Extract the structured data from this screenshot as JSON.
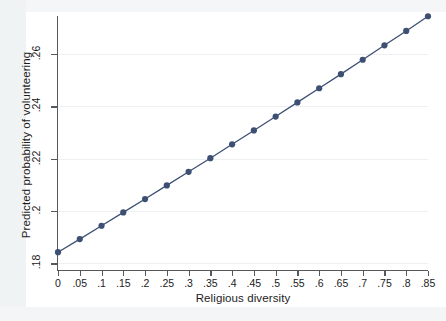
{
  "chart_data": {
    "type": "line",
    "title": "",
    "subtitle": "",
    "xlabel": "Religious diversity",
    "ylabel": "Predicted probability of volunteering",
    "x": [
      0,
      0.05,
      0.1,
      0.15,
      0.2,
      0.25,
      0.3,
      0.35,
      0.4,
      0.45,
      0.5,
      0.55,
      0.6,
      0.65,
      0.7,
      0.75,
      0.8,
      0.85
    ],
    "values": [
      0.1843,
      0.1893,
      0.1944,
      0.1995,
      0.2046,
      0.2098,
      0.215,
      0.2202,
      0.2255,
      0.2308,
      0.2361,
      0.2415,
      0.2469,
      0.2523,
      0.2578,
      0.2633,
      0.2688,
      0.2744
    ],
    "series": [
      {
        "name": "Predicted probability",
        "marker": "circle",
        "values": [
          0.1843,
          0.1893,
          0.1944,
          0.1995,
          0.2046,
          0.2098,
          0.215,
          0.2202,
          0.2255,
          0.2308,
          0.2361,
          0.2415,
          0.2469,
          0.2523,
          0.2578,
          0.2633,
          0.2688,
          0.2744
        ]
      }
    ],
    "xlim": [
      0,
      0.85
    ],
    "ylim": [
      0.1775,
      0.2745
    ],
    "xticks": [
      0,
      0.05,
      0.1,
      0.15,
      0.2,
      0.25,
      0.3,
      0.35,
      0.4,
      0.45,
      0.5,
      0.55,
      0.6,
      0.65,
      0.7,
      0.75,
      0.8,
      0.85
    ],
    "xticklabels": [
      "0",
      ".05",
      ".1",
      ".15",
      ".2",
      ".25",
      ".3",
      ".35",
      ".4",
      ".45",
      ".5",
      ".55",
      ".6",
      ".65",
      ".7",
      ".75",
      ".8",
      ".85"
    ],
    "yticks": [
      0.18,
      0.2,
      0.22,
      0.24,
      0.26
    ],
    "yticklabels": [
      ".18",
      ".2",
      ".22",
      ".24",
      ".26"
    ],
    "grid": "horizontal-faint",
    "legend": "none",
    "series_color": "#3d4f72",
    "marker_color": "#3d4f72",
    "axis_color": "#55595c",
    "grid_color": "#eef1f3",
    "background_color": "#ffffff"
  }
}
